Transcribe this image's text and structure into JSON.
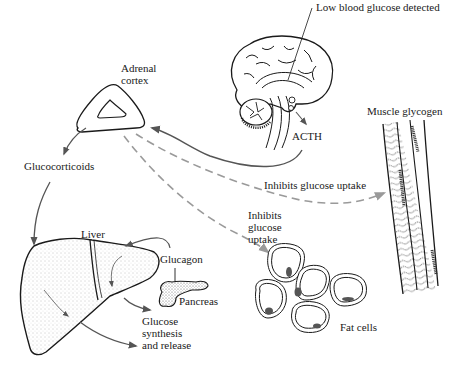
{
  "diagram": {
    "colors": {
      "ink": "#1a1a1a",
      "arrow": "#555555",
      "dashed": "#9a9a9a",
      "stipple": "#777777",
      "background": "#ffffff"
    },
    "nodes": {
      "brain": {
        "label": "Low blood glucose detected",
        "icon": "brain-icon"
      },
      "acth": {
        "label": "ACTH"
      },
      "adrenal": {
        "label_line1": "Adrenal",
        "label_line2": "cortex",
        "icon": "adrenal-gland-icon"
      },
      "glucocorticoids": {
        "label": "Glucocorticoids"
      },
      "muscle": {
        "label": "Muscle glycogen",
        "icon": "muscle-fiber-icon"
      },
      "liver": {
        "label": "Liver",
        "icon": "liver-icon"
      },
      "glucagon": {
        "label": "Glucagon"
      },
      "pancreas": {
        "label": "Pancreas",
        "icon": "pancreas-icon"
      },
      "fat": {
        "label": "Fat cells",
        "icon": "fat-cells-icon"
      }
    },
    "edges": {
      "inhibit_muscle": {
        "label": "Inhibits glucose uptake",
        "style": "dashed"
      },
      "inhibit_fat": {
        "line1": "Inhibits",
        "line2": "glucose",
        "line3": "uptake",
        "style": "dashed"
      },
      "liver_output": {
        "line1": "Glucose",
        "line2": "synthesis",
        "line3": "and release",
        "style": "solid"
      }
    }
  }
}
